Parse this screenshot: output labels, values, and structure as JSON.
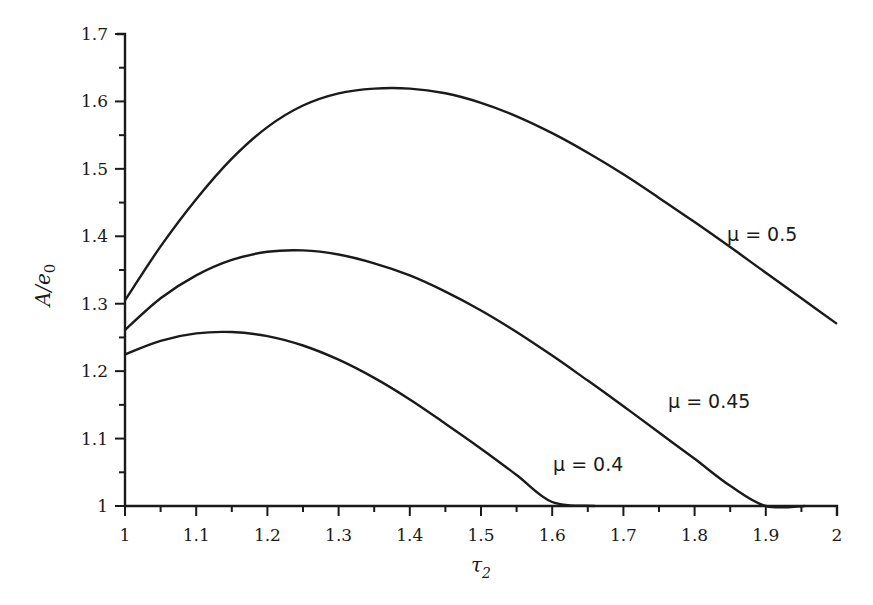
{
  "chart_data": {
    "type": "line",
    "title": "",
    "xlabel": "τ2",
    "ylabel": "A/e0",
    "xlim": [
      1,
      2
    ],
    "ylim": [
      1,
      1.7
    ],
    "grid": false,
    "legend_position": "inline curve labels",
    "x_ticks": [
      "1",
      "1.1",
      "1.2",
      "1.3",
      "1.4",
      "1.5",
      "1.6",
      "1.7",
      "1.8",
      "1.9",
      "2"
    ],
    "y_ticks": [
      "1",
      "1.1",
      "1.2",
      "1.3",
      "1.4",
      "1.5",
      "1.6",
      "1.7"
    ],
    "series": [
      {
        "name": "μ = 0.5",
        "x": [
          1.0,
          1.05,
          1.1,
          1.15,
          1.2,
          1.25,
          1.3,
          1.35,
          1.4,
          1.45,
          1.5,
          1.55,
          1.6,
          1.65,
          1.7,
          1.75,
          1.8,
          1.85,
          1.9,
          1.95,
          2.0
        ],
        "values": [
          1.305,
          1.385,
          1.455,
          1.515,
          1.562,
          1.594,
          1.612,
          1.619,
          1.619,
          1.612,
          1.598,
          1.578,
          1.553,
          1.524,
          1.492,
          1.457,
          1.421,
          1.384,
          1.346,
          1.308,
          1.27
        ]
      },
      {
        "name": "μ = 0.45",
        "x": [
          1.0,
          1.05,
          1.1,
          1.15,
          1.2,
          1.25,
          1.3,
          1.35,
          1.4,
          1.45,
          1.5,
          1.55,
          1.6,
          1.65,
          1.7,
          1.75,
          1.8,
          1.85,
          1.9,
          1.955
        ],
        "values": [
          1.261,
          1.308,
          1.342,
          1.365,
          1.377,
          1.379,
          1.373,
          1.36,
          1.342,
          1.318,
          1.29,
          1.258,
          1.223,
          1.186,
          1.148,
          1.109,
          1.07,
          1.03,
          0.99,
          1.0
        ]
      },
      {
        "name": "μ = 0.4",
        "x": [
          1.0,
          1.05,
          1.1,
          1.15,
          1.2,
          1.25,
          1.3,
          1.35,
          1.4,
          1.45,
          1.5,
          1.55,
          1.6,
          1.66
        ],
        "values": [
          1.225,
          1.245,
          1.256,
          1.258,
          1.252,
          1.238,
          1.217,
          1.19,
          1.158,
          1.122,
          1.085,
          1.046,
          1.006,
          1.0
        ]
      }
    ],
    "annotations": [
      {
        "text": "μ = 0.5",
        "x": 1.86,
        "y": 1.38
      },
      {
        "text": "μ = 0.45",
        "x": 1.7,
        "y": 1.135
      },
      {
        "text": "μ = 0.4",
        "x": 1.51,
        "y": 1.055
      }
    ]
  },
  "labels": {
    "y_axis": "A/e",
    "y_axis_sub": "0",
    "x_axis": "τ",
    "x_axis_sub": "2",
    "curve_05": "μ = 0.5",
    "curve_045": "μ = 0.45",
    "curve_04": "μ = 0.4"
  }
}
